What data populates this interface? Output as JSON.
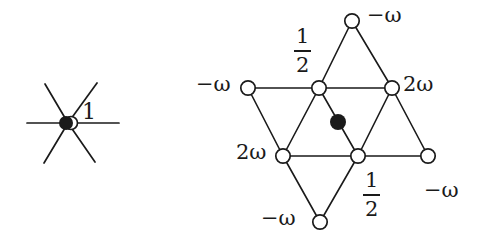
{
  "figure": {
    "background_color": "#ffffff",
    "ink_color": "#1a1a1a",
    "width": 490,
    "height": 244
  },
  "left_figure": {
    "name": "six-ray-vertex",
    "center_label": "1",
    "center_x": 68,
    "center_y": 123,
    "ray_count": 6,
    "has_filled_node": true,
    "has_open_node": true
  },
  "right_figure": {
    "name": "hexagram-lattice",
    "filled_dot": {
      "x": 338,
      "y": 122
    },
    "nodes": [
      {
        "id": "top",
        "x": 352,
        "y": 21,
        "label": "−ω",
        "label_x": 368,
        "label_y": 8,
        "label_align": "left"
      },
      {
        "id": "left",
        "x": 248,
        "y": 88,
        "label": "−ω",
        "label_x": 196,
        "label_y": 76,
        "label_align": "left"
      },
      {
        "id": "center-upper",
        "x": 319,
        "y": 88,
        "label": "1/2",
        "label_x": 296,
        "label_y": 28,
        "label_align": "center"
      },
      {
        "id": "right-upper",
        "x": 392,
        "y": 88,
        "label": "2ω",
        "label_x": 404,
        "label_y": 76,
        "label_align": "left"
      },
      {
        "id": "left-lower",
        "x": 283,
        "y": 156,
        "label": "2ω",
        "label_x": 237,
        "label_y": 144,
        "label_align": "left"
      },
      {
        "id": "center-lower",
        "x": 358,
        "y": 156,
        "label": "1/2",
        "label_x": 364,
        "label_y": 172,
        "label_align": "center"
      },
      {
        "id": "right-far",
        "x": 428,
        "y": 156,
        "label": "−ω",
        "label_x": 424,
        "label_y": 182,
        "label_align": "left"
      },
      {
        "id": "bottom",
        "x": 320,
        "y": 222,
        "label": "−ω",
        "label_x": 262,
        "label_y": 210,
        "label_align": "left"
      }
    ],
    "labels": {
      "top": "−ω",
      "left": "−ω",
      "right_upper": "2ω",
      "left_lower": "2ω",
      "right_far": "−ω",
      "bottom": "−ω",
      "half_numerator": "1",
      "half_denominator": "2"
    },
    "edges": [
      [
        "top",
        "center-upper"
      ],
      [
        "top",
        "right-upper"
      ],
      [
        "left",
        "center-upper"
      ],
      [
        "left",
        "left-lower"
      ],
      [
        "center-upper",
        "right-upper"
      ],
      [
        "center-upper",
        "left-lower"
      ],
      [
        "center-upper",
        "center-lower"
      ],
      [
        "right-upper",
        "center-lower"
      ],
      [
        "right-upper",
        "right-far"
      ],
      [
        "left-lower",
        "center-lower"
      ],
      [
        "left-lower",
        "bottom"
      ],
      [
        "center-lower",
        "right-far"
      ],
      [
        "center-lower",
        "bottom"
      ]
    ]
  }
}
